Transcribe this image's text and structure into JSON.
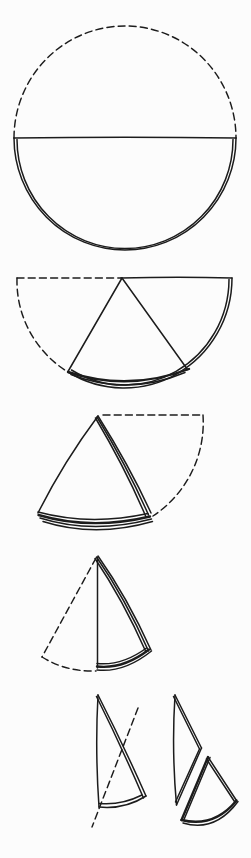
{
  "canvas": {
    "width": 251,
    "height": 858,
    "background": "#fcfcfc",
    "ink": "#1c1c1c"
  },
  "diagram": {
    "name": "circle-folding-sequence",
    "steps": [
      {
        "name": "fold-circle-in-half",
        "paths": [
          {
            "name": "original-circle-top-dashed-arc",
            "d": "M 14 138 A 111 112 0 0 1 236 138",
            "s": "dashed"
          },
          {
            "name": "fold-crease-diameter",
            "d": "M 14 138 Q 125 136.5 236 138",
            "s": "solid"
          },
          {
            "name": "folded-half-outer-edge",
            "d": "M 14 138 A 111 112 0 0 0 236 138",
            "s": "solid"
          },
          {
            "name": "folded-half-inner-edge",
            "d": "M 17 139.5 A 107 108 0 0 0 233 139.5",
            "s": "solid"
          }
        ]
      },
      {
        "name": "fold-semicircle-into-thirds",
        "paths": [
          {
            "name": "original-flap-dashed-top-line",
            "d": "M 17 278 L 121 278",
            "s": "dashed"
          },
          {
            "name": "original-flap-dashed-arc",
            "d": "M 17 278 A 108 107 0 0 0 68 372",
            "s": "dashed"
          },
          {
            "name": "top-folded-edge",
            "d": "M 121 278 Q 180 276.5 232 278",
            "s": "solid"
          },
          {
            "name": "outer-arc-edge",
            "d": "M 232 278 A 108 110 0 0 1 68 372",
            "s": "solid"
          },
          {
            "name": "inner-arc-edge",
            "d": "M 229 279.5 A 104 106 0 0 1 71.5 370",
            "s": "solid"
          },
          {
            "name": "bottom-layered-edge-1",
            "d": "M 68 372 Q 128 392 189 369",
            "s": "bold"
          },
          {
            "name": "bottom-layered-edge-2",
            "d": "M 71 374.5 Q 128 396.5 185 372.5",
            "s": "solid"
          },
          {
            "name": "flap-fold-left-edge",
            "d": "M 122 278 L 68 371.5",
            "s": "solid"
          },
          {
            "name": "flap-fold-right-edge",
            "d": "M 122 278 L 187.5 369.5",
            "s": "solid"
          }
        ]
      },
      {
        "name": "folded-thirds-cone",
        "paths": [
          {
            "name": "flap-original-dashed-top-line",
            "d": "M 103 415 L 203 415",
            "s": "dashed"
          },
          {
            "name": "flap-original-dashed-arc",
            "d": "M 203 415 A 112 112 0 0 1 153 516",
            "s": "dashed"
          },
          {
            "name": "cone-left-edge",
            "d": "M 98 416 Q 63 463 38 513",
            "s": "solid"
          },
          {
            "name": "cone-right-edge-1",
            "d": "M 98 416 Q 130 467 151 513",
            "s": "solid"
          },
          {
            "name": "cone-right-edge-2",
            "d": "M 97 417 Q 128 468 148.5 515",
            "s": "solid"
          },
          {
            "name": "cone-right-edge-3",
            "d": "M 95.5 418 Q 126 469.5 146 517",
            "s": "solid"
          },
          {
            "name": "cone-bottom-layered-edge-1",
            "d": "M 38 512 Q 90 526 148 513.5",
            "s": "solid"
          },
          {
            "name": "cone-bottom-layered-edge-2",
            "d": "M 38.5 515 Q 91 530.5 150 516.5",
            "s": "bold"
          },
          {
            "name": "cone-bottom-layered-edge-3",
            "d": "M 40 518 Q 92.5 534.5 151.5 519",
            "s": "solid"
          },
          {
            "name": "cone-bottom-layered-edge-4",
            "d": "M 43 521.5 Q 95 538 152.5 521.5",
            "s": "solid"
          }
        ]
      },
      {
        "name": "fold-cone-in-half",
        "paths": [
          {
            "name": "original-cone-dashed-left-edge",
            "d": "M 96 558 L 42 657",
            "s": "dashed"
          },
          {
            "name": "original-cone-dashed-arc",
            "d": "M 42 657 Q 66 672 96 671",
            "s": "dashed"
          },
          {
            "name": "center-crease-edge",
            "d": "M 97.5 557 L 97.5 668",
            "s": "solid"
          },
          {
            "name": "cone-right-edge-1",
            "d": "M 98 556 Q 127 597 151 650",
            "s": "solid"
          },
          {
            "name": "cone-right-edge-2",
            "d": "M 96.5 557 Q 125 598 148.5 651",
            "s": "solid"
          },
          {
            "name": "cone-right-edge-3",
            "d": "M 95 558.5 Q 123 600 146 652",
            "s": "solid"
          },
          {
            "name": "cone-bottom-layered-edge-1",
            "d": "M 97 663.5 Q 122 666 146.5 648",
            "s": "solid"
          },
          {
            "name": "cone-bottom-layered-edge-2",
            "d": "M 97 666.5 Q 123 669.5 149 649.5",
            "s": "bold"
          },
          {
            "name": "cone-bottom-layered-edge-3",
            "d": "M 97 670 Q 124 673 151.5 651",
            "s": "solid"
          }
        ]
      },
      {
        "name": "cut-cone-and-pieces",
        "paths": [
          {
            "name": "folded-cone-left-edge",
            "d": "M 98 695 Q 95 750 99 807",
            "s": "solid"
          },
          {
            "name": "folded-cone-right-edge-1",
            "d": "M 98 695 Q 123 744 146 796",
            "s": "solid"
          },
          {
            "name": "folded-cone-right-edge-2",
            "d": "M 96.5 696.5 Q 121 745.5 143.5 798",
            "s": "solid"
          },
          {
            "name": "folded-cone-bottom-edge-1",
            "d": "M 99 807 Q 125 809.5 146 796",
            "s": "solid"
          },
          {
            "name": "folded-cone-bottom-edge-2",
            "d": "M 99.5 803.5 Q 121 805.5 142 795",
            "s": "solid"
          },
          {
            "name": "cut-line-dashed",
            "d": "M 138 708 L 92 827",
            "s": "dashed"
          },
          {
            "name": "top-piece-left-edge",
            "d": "M 175 695 Q 171.5 750 176.5 805",
            "s": "solid"
          },
          {
            "name": "top-piece-upper-right-edge-1",
            "d": "M 175 695 L 201.5 748",
            "s": "solid"
          },
          {
            "name": "top-piece-upper-right-edge-2",
            "d": "M 173.5 696.5 L 199.5 749",
            "s": "solid"
          },
          {
            "name": "top-piece-lower-right-edge-1",
            "d": "M 201.5 748 L 176.5 805",
            "s": "solid"
          },
          {
            "name": "top-piece-lower-right-edge-2",
            "d": "M 199.5 749 L 175.5 802",
            "s": "solid"
          },
          {
            "name": "bottom-piece-left-edge-1",
            "d": "M 208 757 L 181.5 820",
            "s": "bold"
          },
          {
            "name": "bottom-piece-left-edge-2",
            "d": "M 210 757.5 L 184 819.5",
            "s": "solid"
          },
          {
            "name": "bottom-piece-right-edge-1",
            "d": "M 208 757 L 236.5 800.5",
            "s": "solid"
          },
          {
            "name": "bottom-piece-right-edge-2",
            "d": "M 206.5 759 L 234.5 801.5",
            "s": "solid"
          },
          {
            "name": "bottom-piece-bottom-arc-1",
            "d": "M 181.5 820 Q 214 828 236.5 800.5",
            "s": "bold"
          },
          {
            "name": "bottom-piece-bottom-arc-2",
            "d": "M 183 823 Q 215 832.5 238 801.5",
            "s": "solid"
          }
        ]
      }
    ]
  }
}
